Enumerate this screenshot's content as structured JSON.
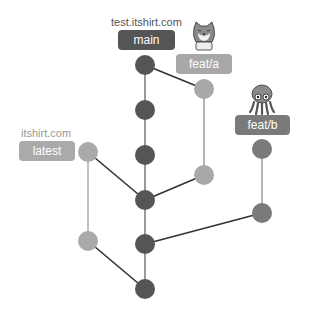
{
  "colors": {
    "main": "#555555",
    "feat_a": "#a8a8a8",
    "feat_b": "#7a7a7a",
    "latest": "#aaaaaa",
    "edge_dark": "#333333",
    "edge_light": "#b0b0b0"
  },
  "branches": {
    "main": {
      "label": "main",
      "host": "test.itshirt.com"
    },
    "feat_a": {
      "label": "feat/a",
      "mascot": "cat-icon"
    },
    "feat_b": {
      "label": "feat/b",
      "mascot": "octopus-icon"
    },
    "latest": {
      "label": "latest",
      "host": "itshirt.com"
    }
  },
  "nodes": [
    {
      "id": "m1",
      "branch": "main",
      "x": 145,
      "y": 65
    },
    {
      "id": "m2",
      "branch": "main",
      "x": 145,
      "y": 110
    },
    {
      "id": "m3",
      "branch": "main",
      "x": 145,
      "y": 155
    },
    {
      "id": "m4",
      "branch": "main",
      "x": 145,
      "y": 200
    },
    {
      "id": "m5",
      "branch": "main",
      "x": 145,
      "y": 244
    },
    {
      "id": "m6",
      "branch": "main",
      "x": 145,
      "y": 289
    },
    {
      "id": "a1",
      "branch": "feat_a",
      "x": 204,
      "y": 89
    },
    {
      "id": "a2",
      "branch": "feat_a",
      "x": 204,
      "y": 175
    },
    {
      "id": "b1",
      "branch": "feat_b",
      "x": 262,
      "y": 149
    },
    {
      "id": "b2",
      "branch": "feat_b",
      "x": 262,
      "y": 213
    },
    {
      "id": "l1",
      "branch": "latest",
      "x": 88,
      "y": 152
    },
    {
      "id": "l2",
      "branch": "latest",
      "x": 88,
      "y": 241
    }
  ]
}
